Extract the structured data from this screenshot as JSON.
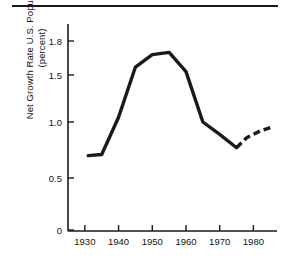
{
  "chart_data": {
    "type": "line",
    "title": "",
    "xlabel": "",
    "ylabel": "Net Growth Rate U.S. Population (percent)",
    "ylabel_line1": "Net Growth Rate U.S. Population",
    "ylabel_line2": "(percent)",
    "xlim": [
      1925,
      1987
    ],
    "ylim": [
      0,
      1.92
    ],
    "grid": false,
    "legend": "none",
    "xticks": [
      1930,
      1940,
      1950,
      1960,
      1970,
      1980
    ],
    "xtick_labels": [
      "1930",
      "1940",
      "1950",
      "1960",
      "1970",
      "1980"
    ],
    "yticks": [
      0,
      0.5,
      1.0,
      1.5,
      1.8
    ],
    "ytick_labels": [
      "0",
      "0.5",
      "1.0",
      "1.5",
      "1.8"
    ],
    "series": [
      {
        "name": "Observed net growth rate",
        "style": "solid",
        "color": "#1a1a1a",
        "x": [
          1931,
          1935,
          1940,
          1945,
          1950,
          1955,
          1960,
          1965,
          1970,
          1975
        ],
        "values": [
          0.7,
          0.71,
          1.05,
          1.57,
          1.68,
          1.7,
          1.53,
          1.0,
          0.89,
          0.77
        ]
      },
      {
        "name": "Projected net growth rate",
        "style": "dashed",
        "color": "#1a1a1a",
        "x": [
          1975,
          1978,
          1982,
          1985
        ],
        "values": [
          0.77,
          0.86,
          0.92,
          0.95
        ]
      }
    ]
  },
  "axes": {
    "y_axis_name": "y-axis",
    "x_axis_name": "x-axis"
  }
}
